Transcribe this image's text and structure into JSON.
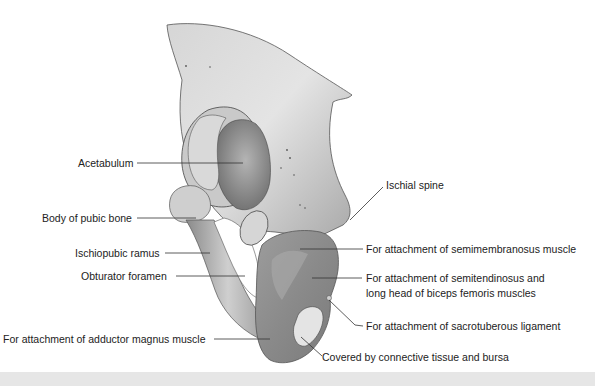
{
  "figure": {
    "colors": {
      "background": "#ffffff",
      "bone_light": "#e2e2e2",
      "bone_mid": "#b5b5b5",
      "bone_dark": "#7d7d7d",
      "leader_line": "#333333",
      "text": "#222222",
      "bottom_band": "#e6e6e6"
    },
    "labels": {
      "acetabulum": "Acetabulum",
      "body_pubic": "Body of pubic bone",
      "ischiopubic_ramus": "Ischiopubic ramus",
      "obturator_foramen": "Obturator foramen",
      "adductor_magnus": "For attachment of adductor magnus muscle",
      "ischial_spine": "Ischial spine",
      "semimembranosus": "For attachment of semimembranosus muscle",
      "semitendinosus_line1": "For attachment of semitendinosus and",
      "semitendinosus_line2": "long head of biceps femoris muscles",
      "sacrotuberous": "For attachment of sacrotuberous ligament",
      "connective_tissue": "Covered by connective tissue and bursa"
    }
  }
}
